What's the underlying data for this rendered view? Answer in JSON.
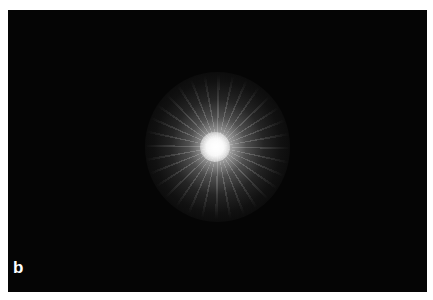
{
  "figure": {
    "panel_label": "b",
    "colors": {
      "background": "#050505",
      "border": "#ffffff",
      "core": "#ffffff"
    }
  }
}
